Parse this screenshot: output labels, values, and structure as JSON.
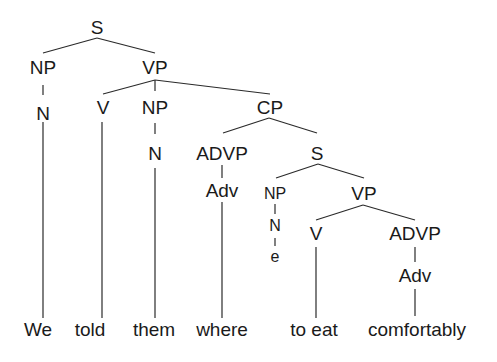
{
  "diagram": {
    "type": "syntax-tree",
    "nodes": {
      "s_root": "S",
      "np_subj": "NP",
      "n_subj": "N",
      "vp_main": "VP",
      "v_main": "V",
      "np_obj": "NP",
      "n_obj": "N",
      "cp": "CP",
      "advp_wh": "ADVP",
      "adv_wh": "Adv",
      "s_emb": "S",
      "np_emb": "NP",
      "n_emb": "N",
      "empty": "e",
      "vp_emb": "VP",
      "v_emb": "V",
      "advp_emb": "ADVP",
      "adv_emb": "Adv"
    },
    "words": [
      "We",
      "told",
      "them",
      "where",
      "to eat",
      "comfortably"
    ]
  }
}
